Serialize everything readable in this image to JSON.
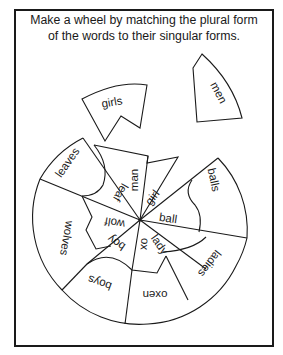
{
  "worksheet": {
    "instructions": {
      "line1": "Make a wheel by matching the plural form",
      "line2": "of the words to their singular forms."
    },
    "loose_pieces": [
      {
        "plural": "girls"
      },
      {
        "plural": "men"
      }
    ],
    "wheel": {
      "plural_words": [
        "leaves",
        "balls",
        "ladies",
        "oxen",
        "boys",
        "wolves"
      ],
      "singular_words": [
        "man",
        "leaf",
        "girl",
        "ball",
        "lady",
        "ox",
        "boy",
        "wolf"
      ]
    },
    "colors": {
      "ink": "#1a1a1a",
      "paper": "#ffffff"
    }
  }
}
